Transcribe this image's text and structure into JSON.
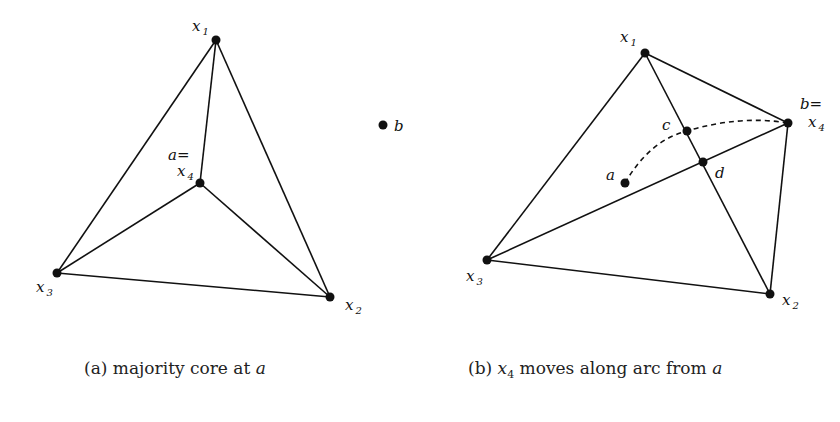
{
  "figure": {
    "panel_a": {
      "caption_prefix": "(a) majority core at ",
      "caption_var": "a",
      "labels": {
        "x1": "x",
        "x1_sub": "1",
        "x2": "x",
        "x2_sub": "2",
        "x3": "x",
        "x3_sub": "3",
        "a_eq": "a=",
        "x4": "x",
        "x4_sub": "4",
        "b": "b"
      },
      "points": {
        "x1": [
          216,
          40
        ],
        "x2": [
          330,
          297
        ],
        "x3": [
          57,
          273
        ],
        "x4": [
          200,
          183
        ],
        "b": [
          383,
          125
        ]
      }
    },
    "panel_b": {
      "caption_prefix": "(b) ",
      "caption_var": "x",
      "caption_sub": "4",
      "caption_rest": " moves along arc from ",
      "caption_var2": "a",
      "labels": {
        "x1": "x",
        "x1_sub": "1",
        "x2": "x",
        "x2_sub": "2",
        "x3": "x",
        "x3_sub": "3",
        "b_eq": "b=",
        "x4": "x",
        "x4_sub": "4",
        "a": "a",
        "c": "c",
        "d": "d"
      },
      "points": {
        "x1": [
          645,
          53
        ],
        "x2": [
          770,
          294
        ],
        "x3": [
          487,
          260
        ],
        "x4": [
          788,
          123
        ],
        "a": [
          625,
          183
        ],
        "c": [
          687,
          131
        ],
        "d": [
          703,
          162
        ]
      }
    }
  }
}
